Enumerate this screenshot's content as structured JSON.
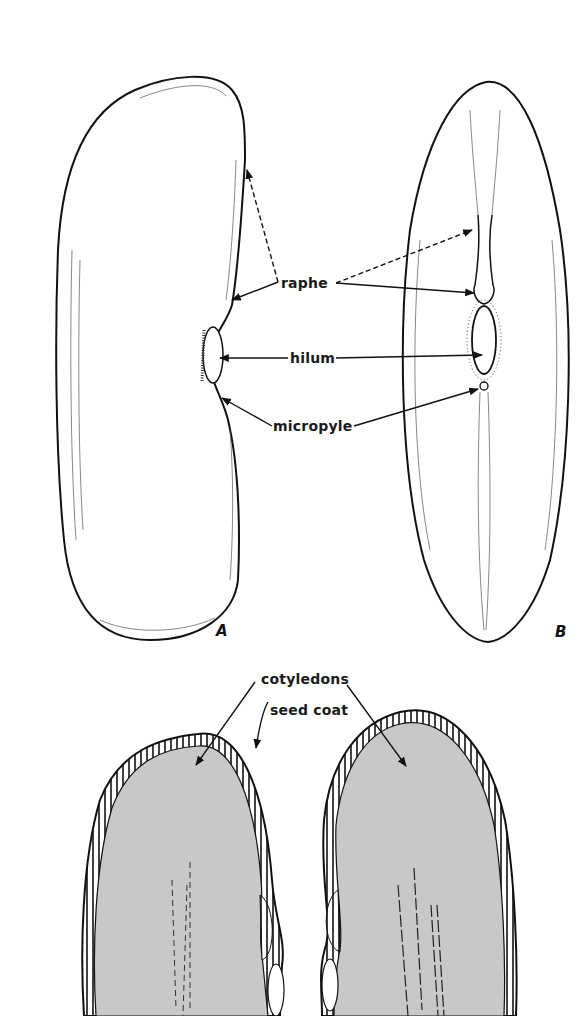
{
  "figure": {
    "panels": [
      {
        "id": "A",
        "label": "A",
        "description": "side view of seed"
      },
      {
        "id": "B",
        "label": "B",
        "description": "hilum-side view of seed"
      },
      {
        "id": "C",
        "label": "",
        "description": "seed split open showing two cotyledons"
      }
    ],
    "labels": {
      "raphe": "raphe",
      "hilum": "hilum",
      "micropyle": "micropyle",
      "cotyledons": "cotyledons",
      "seed_coat": "seed coat"
    },
    "colors": {
      "line": "#111111",
      "cotyledon_fill": "#c8c8c8",
      "background": "#ffffff"
    }
  }
}
